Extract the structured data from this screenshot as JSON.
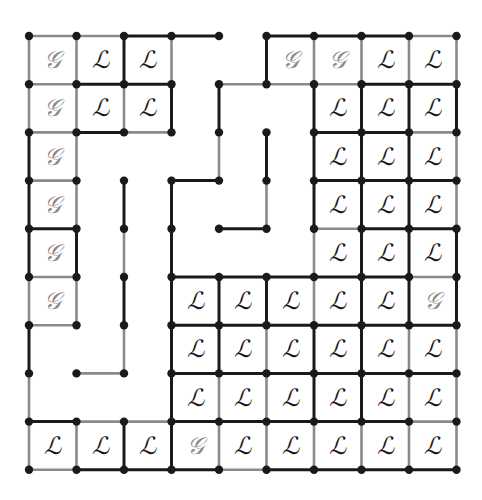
{
  "diagram": {
    "grid": {
      "cols": 9,
      "rows": 9,
      "origin_x": 29,
      "origin_y": 36,
      "step_x": 47.5,
      "step_y": 48.2
    },
    "colors": {
      "black": "#1a1a1a",
      "gray": "#8a8a8a",
      "letter_L": "#1a1a1a",
      "letter_G": "#8a8a8a",
      "background": "#ffffff"
    },
    "labels": {
      "L": "ℒ",
      "G": "𝒢"
    },
    "cells": [
      {
        "c": 0,
        "r": 0,
        "t": "G"
      },
      {
        "c": 1,
        "r": 0,
        "t": "L"
      },
      {
        "c": 2,
        "r": 0,
        "t": "L"
      },
      {
        "c": 5,
        "r": 0,
        "t": "G"
      },
      {
        "c": 6,
        "r": 0,
        "t": "G"
      },
      {
        "c": 7,
        "r": 0,
        "t": "L"
      },
      {
        "c": 8,
        "r": 0,
        "t": "L"
      },
      {
        "c": 0,
        "r": 1,
        "t": "G"
      },
      {
        "c": 1,
        "r": 1,
        "t": "L"
      },
      {
        "c": 2,
        "r": 1,
        "t": "L"
      },
      {
        "c": 6,
        "r": 1,
        "t": "L"
      },
      {
        "c": 7,
        "r": 1,
        "t": "L"
      },
      {
        "c": 8,
        "r": 1,
        "t": "L"
      },
      {
        "c": 0,
        "r": 2,
        "t": "G"
      },
      {
        "c": 6,
        "r": 2,
        "t": "L"
      },
      {
        "c": 7,
        "r": 2,
        "t": "L"
      },
      {
        "c": 8,
        "r": 2,
        "t": "L"
      },
      {
        "c": 0,
        "r": 3,
        "t": "G"
      },
      {
        "c": 6,
        "r": 3,
        "t": "L"
      },
      {
        "c": 7,
        "r": 3,
        "t": "L"
      },
      {
        "c": 8,
        "r": 3,
        "t": "L"
      },
      {
        "c": 0,
        "r": 4,
        "t": "G"
      },
      {
        "c": 6,
        "r": 4,
        "t": "L"
      },
      {
        "c": 7,
        "r": 4,
        "t": "L"
      },
      {
        "c": 8,
        "r": 4,
        "t": "L"
      },
      {
        "c": 0,
        "r": 5,
        "t": "G"
      },
      {
        "c": 3,
        "r": 5,
        "t": "L"
      },
      {
        "c": 4,
        "r": 5,
        "t": "L"
      },
      {
        "c": 5,
        "r": 5,
        "t": "L"
      },
      {
        "c": 6,
        "r": 5,
        "t": "L"
      },
      {
        "c": 7,
        "r": 5,
        "t": "L"
      },
      {
        "c": 8,
        "r": 5,
        "t": "G"
      },
      {
        "c": 3,
        "r": 6,
        "t": "L"
      },
      {
        "c": 4,
        "r": 6,
        "t": "L"
      },
      {
        "c": 5,
        "r": 6,
        "t": "L"
      },
      {
        "c": 6,
        "r": 6,
        "t": "L"
      },
      {
        "c": 7,
        "r": 6,
        "t": "L"
      },
      {
        "c": 8,
        "r": 6,
        "t": "L"
      },
      {
        "c": 3,
        "r": 7,
        "t": "L"
      },
      {
        "c": 4,
        "r": 7,
        "t": "L"
      },
      {
        "c": 5,
        "r": 7,
        "t": "L"
      },
      {
        "c": 6,
        "r": 7,
        "t": "L"
      },
      {
        "c": 7,
        "r": 7,
        "t": "L"
      },
      {
        "c": 8,
        "r": 7,
        "t": "L"
      },
      {
        "c": 0,
        "r": 8,
        "t": "L"
      },
      {
        "c": 1,
        "r": 8,
        "t": "L"
      },
      {
        "c": 2,
        "r": 8,
        "t": "L"
      },
      {
        "c": 3,
        "r": 8,
        "t": "G"
      },
      {
        "c": 4,
        "r": 8,
        "t": "L"
      },
      {
        "c": 5,
        "r": 8,
        "t": "L"
      },
      {
        "c": 6,
        "r": 8,
        "t": "L"
      },
      {
        "c": 7,
        "r": 8,
        "t": "L"
      },
      {
        "c": 8,
        "r": 8,
        "t": "L"
      }
    ],
    "h_edges": [
      [
        0,
        0,
        "g"
      ],
      [
        1,
        0,
        "g"
      ],
      [
        2,
        0,
        "b"
      ],
      [
        3,
        0,
        "b"
      ],
      [
        5,
        0,
        "b"
      ],
      [
        6,
        0,
        "b"
      ],
      [
        7,
        0,
        "b"
      ],
      [
        8,
        0,
        "g"
      ],
      [
        0,
        1,
        "g"
      ],
      [
        1,
        1,
        "b"
      ],
      [
        2,
        1,
        "b"
      ],
      [
        4,
        1,
        "g"
      ],
      [
        5,
        1,
        "g"
      ],
      [
        6,
        1,
        "g"
      ],
      [
        7,
        1,
        "b"
      ],
      [
        8,
        1,
        "b"
      ],
      [
        0,
        2,
        "g"
      ],
      [
        1,
        2,
        "b"
      ],
      [
        2,
        2,
        "g"
      ],
      [
        6,
        2,
        "b"
      ],
      [
        7,
        2,
        "b"
      ],
      [
        8,
        2,
        "g"
      ],
      [
        0,
        3,
        "g"
      ],
      [
        3,
        3,
        "b"
      ],
      [
        6,
        3,
        "b"
      ],
      [
        7,
        3,
        "b"
      ],
      [
        8,
        3,
        "b"
      ],
      [
        0,
        4,
        "b"
      ],
      [
        4,
        4,
        "b"
      ],
      [
        6,
        4,
        "g"
      ],
      [
        7,
        4,
        "b"
      ],
      [
        8,
        4,
        "b"
      ],
      [
        0,
        5,
        "g"
      ],
      [
        3,
        5,
        "b"
      ],
      [
        4,
        5,
        "b"
      ],
      [
        5,
        5,
        "b"
      ],
      [
        6,
        5,
        "b"
      ],
      [
        7,
        5,
        "b"
      ],
      [
        8,
        5,
        "g"
      ],
      [
        0,
        6,
        "g"
      ],
      [
        3,
        6,
        "b"
      ],
      [
        4,
        6,
        "b"
      ],
      [
        5,
        6,
        "b"
      ],
      [
        6,
        6,
        "b"
      ],
      [
        7,
        6,
        "b"
      ],
      [
        8,
        6,
        "b"
      ],
      [
        1,
        7,
        "g"
      ],
      [
        3,
        7,
        "b"
      ],
      [
        4,
        7,
        "b"
      ],
      [
        5,
        7,
        "b"
      ],
      [
        6,
        7,
        "b"
      ],
      [
        7,
        7,
        "b"
      ],
      [
        8,
        7,
        "b"
      ],
      [
        0,
        8,
        "b"
      ],
      [
        1,
        8,
        "g"
      ],
      [
        2,
        8,
        "g"
      ],
      [
        3,
        8,
        "b"
      ],
      [
        4,
        8,
        "b"
      ],
      [
        5,
        8,
        "b"
      ],
      [
        6,
        8,
        "b"
      ],
      [
        7,
        8,
        "b"
      ],
      [
        8,
        8,
        "g"
      ],
      [
        0,
        9,
        "g"
      ],
      [
        1,
        9,
        "b"
      ],
      [
        2,
        9,
        "b"
      ],
      [
        3,
        9,
        "b"
      ],
      [
        4,
        9,
        "g"
      ],
      [
        5,
        9,
        "b"
      ],
      [
        6,
        9,
        "b"
      ],
      [
        7,
        9,
        "b"
      ],
      [
        8,
        9,
        "b"
      ]
    ],
    "v_edges": [
      [
        0,
        0,
        "g"
      ],
      [
        1,
        0,
        "g"
      ],
      [
        2,
        0,
        "b"
      ],
      [
        3,
        0,
        "g"
      ],
      [
        5,
        0,
        "b"
      ],
      [
        6,
        0,
        "g"
      ],
      [
        7,
        0,
        "g"
      ],
      [
        8,
        0,
        "g"
      ],
      [
        9,
        0,
        "g"
      ],
      [
        0,
        1,
        "g"
      ],
      [
        1,
        1,
        "g"
      ],
      [
        2,
        1,
        "g"
      ],
      [
        3,
        1,
        "b"
      ],
      [
        4,
        1,
        "b"
      ],
      [
        6,
        1,
        "b"
      ],
      [
        7,
        1,
        "b"
      ],
      [
        8,
        1,
        "b"
      ],
      [
        9,
        1,
        "b"
      ],
      [
        0,
        2,
        "b"
      ],
      [
        1,
        2,
        "g"
      ],
      [
        4,
        2,
        "g"
      ],
      [
        5,
        2,
        "b"
      ],
      [
        6,
        2,
        "b"
      ],
      [
        7,
        2,
        "b"
      ],
      [
        8,
        2,
        "b"
      ],
      [
        9,
        2,
        "g"
      ],
      [
        0,
        3,
        "b"
      ],
      [
        1,
        3,
        "g"
      ],
      [
        2,
        3,
        "b"
      ],
      [
        3,
        3,
        "b"
      ],
      [
        5,
        3,
        "g"
      ],
      [
        6,
        3,
        "b"
      ],
      [
        7,
        3,
        "b"
      ],
      [
        8,
        3,
        "b"
      ],
      [
        9,
        3,
        "g"
      ],
      [
        0,
        4,
        "b"
      ],
      [
        1,
        4,
        "b"
      ],
      [
        2,
        4,
        "g"
      ],
      [
        3,
        4,
        "b"
      ],
      [
        6,
        4,
        "g"
      ],
      [
        7,
        4,
        "b"
      ],
      [
        8,
        4,
        "b"
      ],
      [
        9,
        4,
        "b"
      ],
      [
        0,
        5,
        "g"
      ],
      [
        1,
        5,
        "g"
      ],
      [
        2,
        5,
        "b"
      ],
      [
        3,
        5,
        "b"
      ],
      [
        4,
        5,
        "b"
      ],
      [
        5,
        5,
        "b"
      ],
      [
        6,
        5,
        "g"
      ],
      [
        7,
        5,
        "b"
      ],
      [
        8,
        5,
        "b"
      ],
      [
        9,
        5,
        "b"
      ],
      [
        0,
        6,
        "b"
      ],
      [
        2,
        6,
        "g"
      ],
      [
        3,
        6,
        "b"
      ],
      [
        4,
        6,
        "b"
      ],
      [
        5,
        6,
        "g"
      ],
      [
        6,
        6,
        "b"
      ],
      [
        7,
        6,
        "b"
      ],
      [
        8,
        6,
        "g"
      ],
      [
        9,
        6,
        "g"
      ],
      [
        0,
        7,
        "g"
      ],
      [
        3,
        7,
        "b"
      ],
      [
        4,
        7,
        "g"
      ],
      [
        5,
        7,
        "g"
      ],
      [
        6,
        7,
        "b"
      ],
      [
        7,
        7,
        "b"
      ],
      [
        8,
        7,
        "g"
      ],
      [
        9,
        7,
        "g"
      ],
      [
        0,
        8,
        "g"
      ],
      [
        1,
        8,
        "g"
      ],
      [
        2,
        8,
        "b"
      ],
      [
        3,
        8,
        "b"
      ],
      [
        4,
        8,
        "g"
      ],
      [
        5,
        8,
        "g"
      ],
      [
        6,
        8,
        "g"
      ],
      [
        7,
        8,
        "g"
      ],
      [
        8,
        8,
        "g"
      ],
      [
        9,
        8,
        "g"
      ]
    ]
  }
}
